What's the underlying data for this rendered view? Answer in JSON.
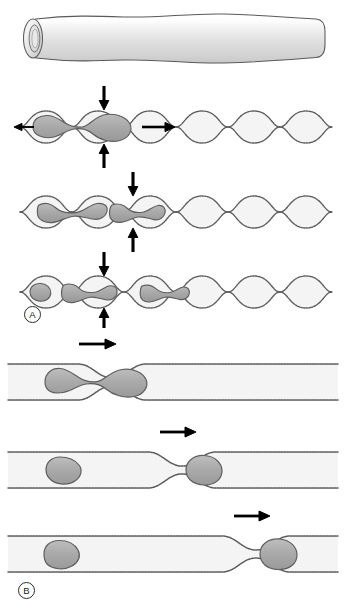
{
  "figure": {
    "panels": [
      {
        "id": "panel-a",
        "label": "A",
        "description": "Sinusoidal beaded capillary; a cell is progressively squeezed and divided across three sequential stages.",
        "vessel_type": "wavy",
        "stages": [
          {
            "stage": 1,
            "cell_state": "single elongated cell spanning one constriction",
            "arrows": [
              "down",
              "up",
              "right",
              "left"
            ]
          },
          {
            "stage": 2,
            "cell_state": "cell separating into two dumbbell segments",
            "arrows": [
              "down",
              "up"
            ]
          },
          {
            "stage": 3,
            "cell_state": "three separate cell fragments in successive bulges",
            "arrows": [
              "down",
              "up"
            ]
          }
        ]
      },
      {
        "id": "panel-b",
        "label": "B",
        "description": "Straight capillary with a single localized stenosis; a cell approaches, lodges and passes the narrow point.",
        "vessel_type": "straight",
        "stages": [
          {
            "stage": 1,
            "cell_state": "elongated cell straddling the constriction",
            "arrows": [
              "right"
            ]
          },
          {
            "stage": 2,
            "cell_state": "round cell upstream, second cell lodged at constriction exit",
            "arrows": [
              "right"
            ]
          },
          {
            "stage": 3,
            "cell_state": "round cell far upstream, cell lodged at distal constriction",
            "arrows": [
              "right"
            ]
          }
        ]
      }
    ],
    "top_illustration": {
      "name": "three-dimensional vessel segment",
      "description": "Shaded cylindrical tube with open lumen at the left end"
    },
    "colors": {
      "cell_fill": "#a9a9a9",
      "cell_outline": "#555555",
      "vessel_wall": "#5a5a5a",
      "lumen_fill": "#f4f4f4",
      "tube_body": "#e2e2e2",
      "arrow": "#000000",
      "label_text": "#1a1a1a"
    }
  }
}
